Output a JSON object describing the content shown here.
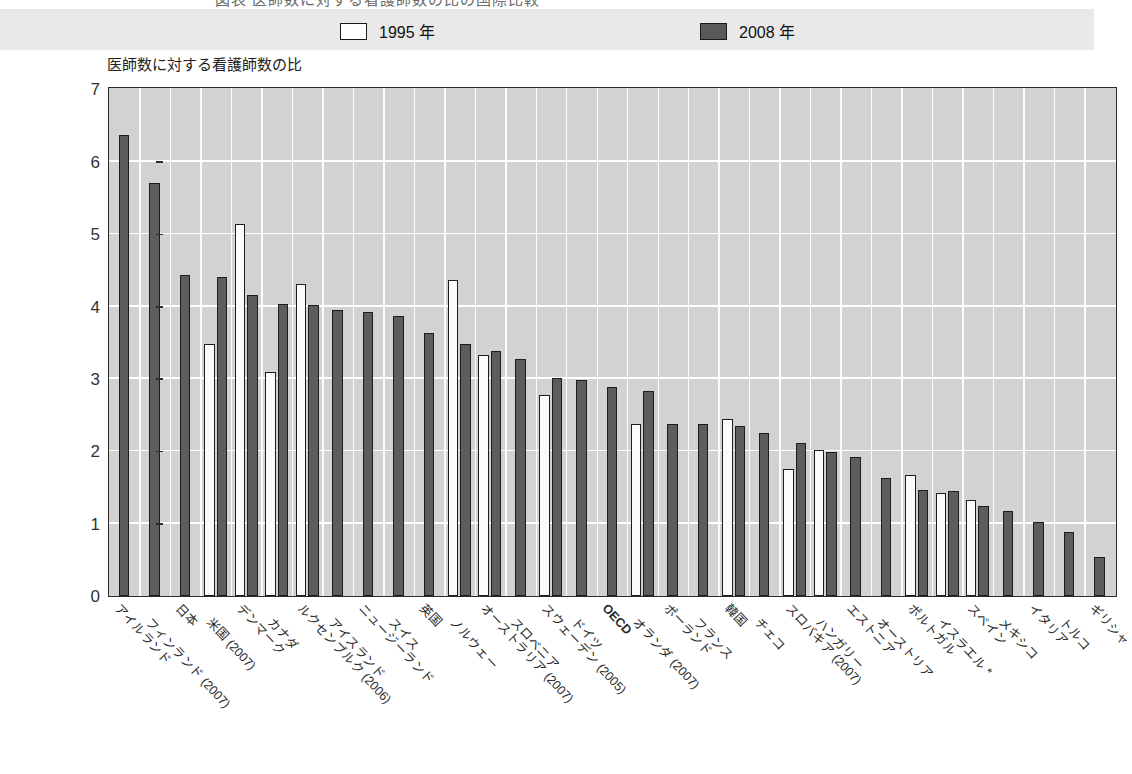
{
  "title_partial": "図表  医師数に対する看護師数の比の国際比較",
  "legend": {
    "items": [
      {
        "label": "1995 年",
        "style": "open",
        "color": "#ffffff",
        "name": "legend-1995"
      },
      {
        "label": "2008 年",
        "style": "filled",
        "color": "#5d5d5d",
        "name": "legend-2008"
      }
    ]
  },
  "axis": {
    "y_caption": "医師数に対する看護師数の比",
    "y_ticks": [
      "0",
      "1",
      "2",
      "3",
      "4",
      "5",
      "6",
      "7"
    ]
  },
  "chart_data": {
    "type": "bar",
    "title": "医師数に対する看護師数の比",
    "xlabel": "",
    "ylabel": "医師数に対する看護師数の比",
    "ylim": [
      0,
      7
    ],
    "ytick_step": 1,
    "grid": true,
    "legend_position": "top",
    "categories": [
      "アイルランド",
      "フィンランド (2007)",
      "日本",
      "米国 (2007)",
      "デンマーク",
      "カナダ",
      "ルクセンブルク (2006)",
      "アイスランド",
      "ニュージーランド",
      "スイス",
      "英国",
      "ノルウェー",
      "オーストラリア (2007)",
      "スロベニア",
      "スウェーデン (2005)",
      "ドイツ",
      "OECD",
      "オランダ (2007)",
      "ポーランド",
      "フランス",
      "韓国",
      "チェコ",
      "スロバキア (2007)",
      "ハンガリー",
      "エストニア",
      "オーストリア",
      "ポルトガル",
      "イスラエル *",
      "スペイン",
      "メキシコ",
      "イタリア",
      "トルコ",
      "ギリシャ"
    ],
    "series": [
      {
        "name": "1995 年",
        "values": [
          null,
          null,
          null,
          3.48,
          5.14,
          3.09,
          4.31,
          null,
          null,
          null,
          null,
          4.36,
          3.33,
          null,
          2.78,
          null,
          null,
          2.38,
          null,
          null,
          2.45,
          null,
          1.76,
          2.02,
          null,
          null,
          1.67,
          1.43,
          1.33,
          null,
          null,
          null,
          null
        ]
      },
      {
        "name": "2008 年",
        "values": [
          6.37,
          5.7,
          4.43,
          4.41,
          4.16,
          4.03,
          4.02,
          3.95,
          3.93,
          3.87,
          3.63,
          3.48,
          3.39,
          3.27,
          3.01,
          2.99,
          2.89,
          2.83,
          2.38,
          2.37,
          2.35,
          2.25,
          2.11,
          1.99,
          1.92,
          1.63,
          1.46,
          1.45,
          1.24,
          1.18,
          1.02,
          0.89,
          0.54
        ]
      }
    ],
    "note": "OECD カテゴリは太字"
  }
}
